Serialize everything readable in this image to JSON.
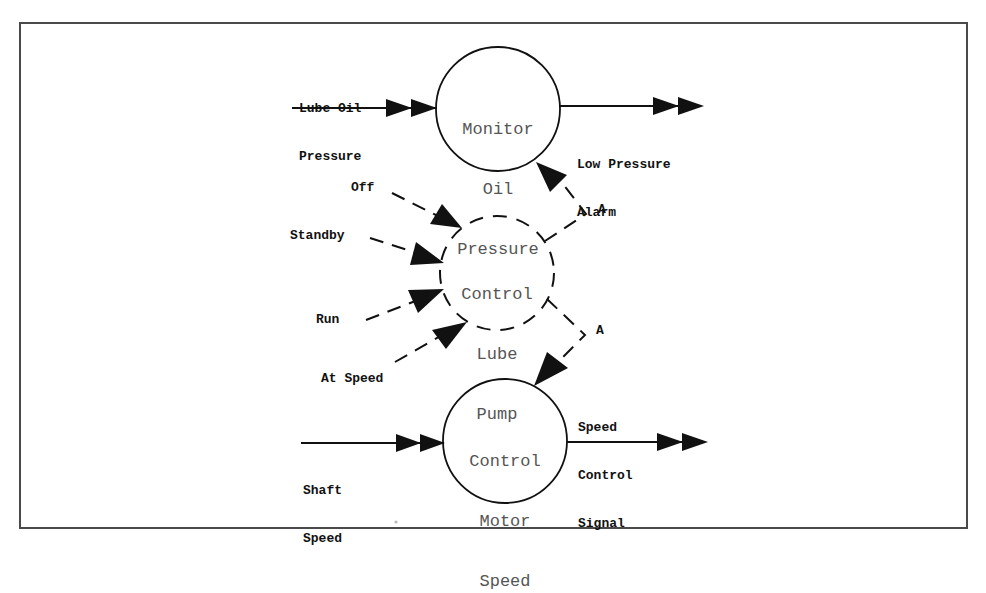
{
  "diagram": {
    "type": "data-flow",
    "processes": [
      {
        "id": "monitor",
        "lines": [
          "Monitor",
          "Oil",
          "Pressure"
        ],
        "style": "solid"
      },
      {
        "id": "lube_pump",
        "lines": [
          "Control",
          "Lube",
          "Pump"
        ],
        "style": "dashed"
      },
      {
        "id": "motor",
        "lines": [
          "Control",
          "Motor",
          "Speed"
        ],
        "style": "solid"
      }
    ],
    "flows": {
      "lube_oil_pressure": {
        "lines": [
          "Lube Oil",
          "Pressure"
        ],
        "kind": "data-continuous",
        "to": "monitor"
      },
      "low_pressure_alarm": {
        "lines": [
          "Low Pressure",
          "Alarm"
        ],
        "kind": "data-continuous",
        "from": "monitor"
      },
      "off": {
        "label": "Off",
        "kind": "control-event",
        "to": "lube_pump"
      },
      "standby": {
        "label": "Standby",
        "kind": "control-event",
        "to": "lube_pump"
      },
      "run": {
        "label": "Run",
        "kind": "control-event",
        "to": "lube_pump"
      },
      "at_speed": {
        "label": "At Speed",
        "kind": "control-event",
        "to": "lube_pump"
      },
      "activate_monitor": {
        "label": "A",
        "kind": "activation",
        "from": "lube_pump",
        "to": "monitor"
      },
      "activate_motor": {
        "label": "A",
        "kind": "activation",
        "from": "lube_pump",
        "to": "motor"
      },
      "shaft_speed": {
        "lines": [
          "Shaft",
          "Speed"
        ],
        "kind": "data-continuous",
        "to": "motor"
      },
      "speed_control_signal": {
        "lines": [
          "Speed",
          "Control",
          "Signal"
        ],
        "kind": "data-continuous",
        "from": "motor"
      }
    },
    "colors": {
      "stroke": "#111111",
      "frame": "#4a4a4a",
      "process_text": "#555555",
      "label_text": "#111111"
    }
  }
}
